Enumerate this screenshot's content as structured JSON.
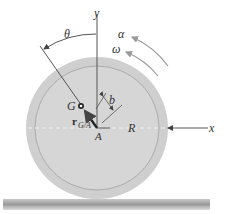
{
  "diagram": {
    "type": "rolling disk kinematics",
    "labels": {
      "y_axis": "y",
      "x_axis": "x",
      "theta": "θ",
      "alpha": "α",
      "omega": "ω",
      "G": "G",
      "b": "b",
      "A": "A",
      "R": "R",
      "r_vector": "r",
      "r_subscript": "G/A"
    },
    "colors": {
      "disk_outer": "#cfcfcf",
      "disk_inner": "#d8d8d8",
      "ring_line": "#a8a8a8",
      "ground": "#a0a0a0",
      "line": "#444444",
      "arrow_gray": "#9a9a9a"
    }
  }
}
